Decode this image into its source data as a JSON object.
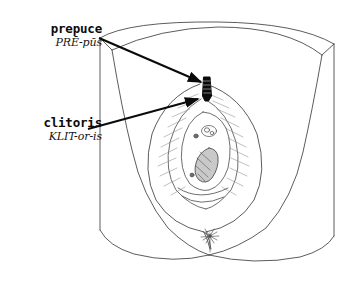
{
  "figure": {
    "type": "anatomical-line-drawing",
    "background_color": "#ffffff",
    "line_color": "#4a4a4a",
    "highlight_color": "#0a0a0a",
    "width": 349,
    "height": 282
  },
  "labels": [
    {
      "id": "prepuce",
      "term": "prepuce",
      "pronunciation": "PRĒ-pūs",
      "text_x": 18,
      "text_y": 22,
      "arrow_from_x": 99,
      "arrow_from_y": 38,
      "arrow_to_x": 204,
      "arrow_to_y": 84
    },
    {
      "id": "clitoris",
      "term": "clitoris",
      "pronunciation": "KLIT-or-is",
      "text_x": 6,
      "text_y": 116,
      "arrow_from_x": 88,
      "arrow_from_y": 129,
      "arrow_to_x": 201,
      "arrow_to_y": 99
    }
  ],
  "structures": [
    {
      "id": "outer-frame",
      "name": "illustration border"
    },
    {
      "id": "mons-arc",
      "name": "mons pubis arc"
    },
    {
      "id": "labia-majora",
      "name": "labia majora outline"
    },
    {
      "id": "labia-minora",
      "name": "labia minora outline"
    },
    {
      "id": "prepuce-mark",
      "name": "prepuce highlighted band",
      "color": "#0a0a0a"
    },
    {
      "id": "vestibule",
      "name": "vestibule oval"
    },
    {
      "id": "urethral-opening",
      "name": "urethral opening"
    },
    {
      "id": "vaginal-opening",
      "name": "vaginal opening"
    },
    {
      "id": "anus",
      "name": "anus starburst"
    },
    {
      "id": "thigh-left",
      "name": "left thigh curve"
    },
    {
      "id": "thigh-right",
      "name": "right thigh curve"
    }
  ]
}
